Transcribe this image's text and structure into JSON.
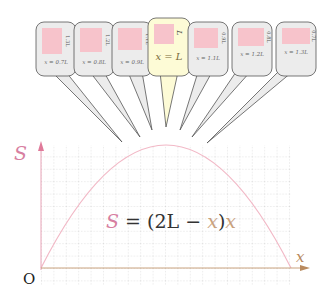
{
  "diagram": {
    "title": "",
    "axes": {
      "y_label": "S",
      "x_label": "x",
      "origin_label": "O"
    },
    "equation": {
      "S": "S",
      "eq": " = (2L − ",
      "x1": "x",
      "close": ")",
      "x2": "x"
    },
    "callouts": [
      {
        "x_label": "x = 0.7L",
        "side_label": "1.3L",
        "highlight": false
      },
      {
        "x_label": "x = 0.8L",
        "side_label": "1.2L",
        "highlight": false
      },
      {
        "x_label": "x = 0.9L",
        "side_label": "1.1L",
        "highlight": false
      },
      {
        "x_label": "x = L",
        "side_label": "L",
        "highlight": true
      },
      {
        "x_label": "x = 1.1L",
        "side_label": "0.9L",
        "highlight": false
      },
      {
        "x_label": "x = 1.2L",
        "side_label": "0.8L",
        "highlight": false
      },
      {
        "x_label": "x = 1.3L",
        "side_label": "0.7L",
        "highlight": false
      }
    ],
    "colors": {
      "curve": "#f2b8c6",
      "axis_y": "#e07a9a",
      "axis_x": "#c9a27e",
      "S_label": "#d77fa1",
      "x_label": "#b98a5e",
      "grid": "#bdbdbd",
      "callout_fill": "#ececec",
      "callout_highlight_fill": "#fdfbd6",
      "rect_fill": "#f7c3cb"
    }
  }
}
